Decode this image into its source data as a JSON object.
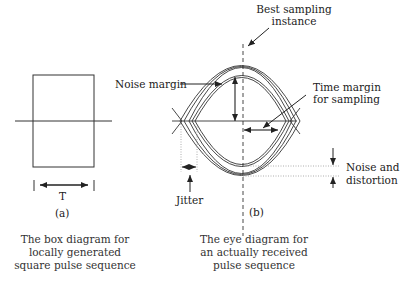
{
  "diagram": {
    "box_panel": {
      "period_label": "T",
      "panel_label": "(a)",
      "caption": [
        "The box diagram for",
        "locally generated",
        "square pulse sequence"
      ]
    },
    "eye_panel": {
      "panel_label": "(b)",
      "caption": [
        "The eye diagram for",
        "an actually received",
        "pulse sequence"
      ],
      "annotations": {
        "best_sampling": [
          "Best sampling",
          "instance"
        ],
        "noise_margin": "Noise margin",
        "time_margin": [
          "Time margin",
          "for sampling"
        ],
        "jitter": "Jitter",
        "noise_distortion": [
          "Noise and",
          "distortion"
        ]
      }
    },
    "colors": {
      "stroke": "#222222",
      "dotted": "#888888",
      "text": "#222222"
    }
  }
}
